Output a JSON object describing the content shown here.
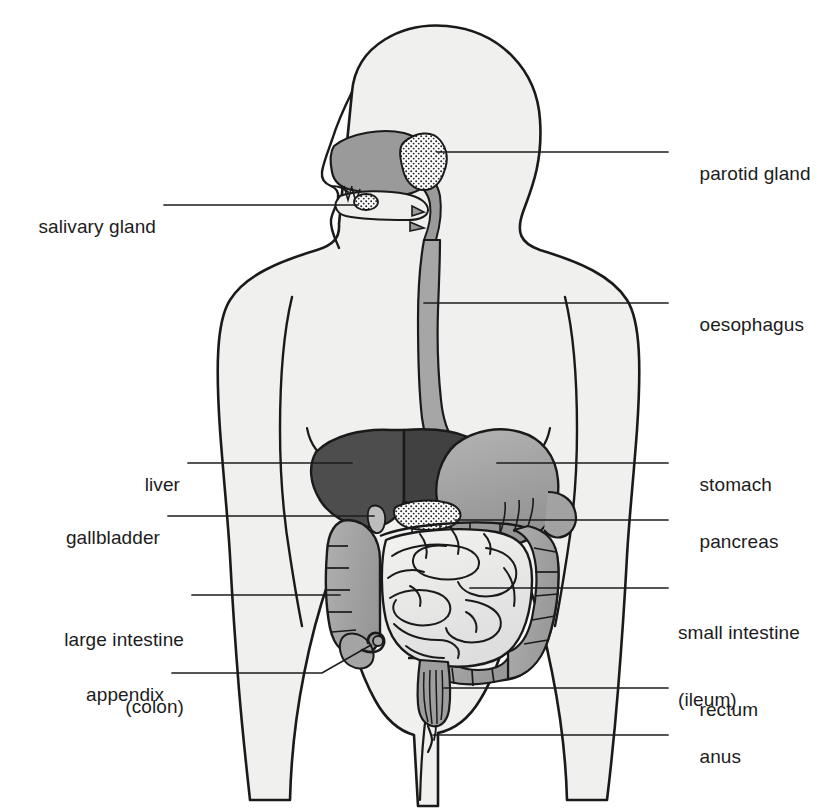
{
  "diagram": {
    "view": "anterior body silhouette with sagittal head",
    "background_color": "#ffffff",
    "outline_color": "#1a1a1a",
    "body_fill": "#f0f0ee",
    "leader_color": "#1c1c1c"
  },
  "palette": {
    "body": "#f0f0ee",
    "liver": "#4d4d4d",
    "liver_dark": "#3f3f3f",
    "stomach": "#a8a8a8",
    "stomach_shade": "#969696",
    "oesophagus": "#a6a6a6",
    "cavity": "#9a9a9a",
    "colon": "#a9a9a9",
    "colon_shade": "#9a9a9a",
    "small_intestine": "#e8e8e6",
    "pancreas": "#ededeb",
    "gallbladder": "#bdbdbd",
    "rectum": "#9e9e9e",
    "gland_stipple": "#ffffff",
    "outline": "#1a1a1a"
  },
  "labels_left": [
    {
      "id": "salivary-gland",
      "text": "salivary gland",
      "lines": [
        "salivary gland"
      ]
    },
    {
      "id": "liver",
      "text": "liver",
      "lines": [
        "liver"
      ]
    },
    {
      "id": "gallbladder",
      "text": "gallbladder",
      "lines": [
        "gallbladder"
      ]
    },
    {
      "id": "large-intestine",
      "text": "large intestine (colon)",
      "lines": [
        "large intestine",
        "(colon)"
      ]
    },
    {
      "id": "appendix",
      "text": "appendix",
      "lines": [
        "appendix"
      ]
    }
  ],
  "labels_right": [
    {
      "id": "parotid-gland",
      "text": "parotid gland",
      "lines": [
        "parotid gland"
      ]
    },
    {
      "id": "oesophagus",
      "text": "oesophagus",
      "lines": [
        "oesophagus"
      ]
    },
    {
      "id": "stomach",
      "text": "stomach",
      "lines": [
        "stomach"
      ]
    },
    {
      "id": "pancreas",
      "text": "pancreas",
      "lines": [
        "pancreas"
      ]
    },
    {
      "id": "small-intestine",
      "text": "small intestine (ileum)",
      "lines": [
        "small intestine",
        "(ileum)"
      ]
    },
    {
      "id": "rectum",
      "text": "rectum",
      "lines": [
        "rectum"
      ]
    },
    {
      "id": "anus",
      "text": "anus",
      "lines": [
        "anus"
      ]
    }
  ],
  "text": {
    "salivary_gland": "salivary gland",
    "liver": "liver",
    "gallbladder": "gallbladder",
    "large_intestine_1": "large intestine",
    "large_intestine_2": "(colon)",
    "appendix": "appendix",
    "parotid_gland": "parotid gland",
    "oesophagus": "oesophagus",
    "stomach": "stomach",
    "pancreas": "pancreas",
    "small_intestine_1": "small intestine",
    "small_intestine_2": "(ileum)",
    "rectum": "rectum",
    "anus": "anus"
  }
}
